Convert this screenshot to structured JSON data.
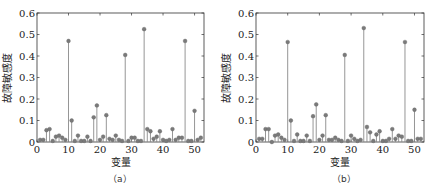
{
  "chart_data": [
    {
      "type": "stem",
      "panel_label": "（a）",
      "title": "",
      "xlabel": "变量",
      "ylabel": "故障敏感度",
      "xlim": [
        0,
        53
      ],
      "ylim": [
        0,
        0.6
      ],
      "xticks": [
        0,
        10,
        20,
        30,
        40,
        50
      ],
      "yticks": [
        0,
        0.1,
        0.2,
        0.3,
        0.4,
        0.5,
        0.6
      ],
      "ytick_labels": [
        "0",
        "0.1",
        "0.2",
        "0.3",
        "0.4",
        "0.5",
        "0.6"
      ],
      "grid": false,
      "x": [
        1,
        2,
        3,
        4,
        5,
        6,
        7,
        8,
        9,
        10,
        11,
        12,
        13,
        14,
        15,
        16,
        17,
        18,
        19,
        20,
        21,
        22,
        23,
        24,
        25,
        26,
        27,
        28,
        29,
        30,
        31,
        32,
        33,
        34,
        35,
        36,
        37,
        38,
        39,
        40,
        41,
        42,
        43,
        44,
        45,
        46,
        47,
        48,
        49,
        50,
        51,
        52
      ],
      "values": [
        0.01,
        0.01,
        0.055,
        0.06,
        0.005,
        0.025,
        0.03,
        0.02,
        0.01,
        0.47,
        0.1,
        0.005,
        0.03,
        0.005,
        0.005,
        0.025,
        0.005,
        0.115,
        0.17,
        0.01,
        0.025,
        0.125,
        0.015,
        0.01,
        0.03,
        0.01,
        0.005,
        0.405,
        0.005,
        0.02,
        0.02,
        0.005,
        0.005,
        0.525,
        0.06,
        0.05,
        0.015,
        0.025,
        0.05,
        0.01,
        0.005,
        0.01,
        0.06,
        0.01,
        0.02,
        0.02,
        0.47,
        0.005,
        0.005,
        0.145,
        0.01,
        0.02
      ]
    },
    {
      "type": "stem",
      "panel_label": "（b）",
      "title": "",
      "xlabel": "变量",
      "ylabel": "故障敏感度",
      "xlim": [
        0,
        53
      ],
      "ylim": [
        0,
        0.6
      ],
      "xticks": [
        0,
        10,
        20,
        30,
        40,
        50
      ],
      "yticks": [
        0,
        0.1,
        0.2,
        0.3,
        0.4,
        0.5,
        0.6
      ],
      "ytick_labels": [
        "0",
        "0.1",
        "0.2",
        "0.3",
        "0.4",
        "0.5",
        "0.6"
      ],
      "grid": false,
      "x": [
        1,
        2,
        3,
        4,
        5,
        6,
        7,
        8,
        9,
        10,
        11,
        12,
        13,
        14,
        15,
        16,
        17,
        18,
        19,
        20,
        21,
        22,
        23,
        24,
        25,
        26,
        27,
        28,
        29,
        30,
        31,
        32,
        33,
        34,
        35,
        36,
        37,
        38,
        39,
        40,
        41,
        42,
        43,
        44,
        45,
        46,
        47,
        48,
        49,
        50,
        51,
        52
      ],
      "values": [
        0.015,
        0.015,
        0.06,
        0.06,
        0.0,
        0.03,
        0.035,
        0.02,
        0.01,
        0.465,
        0.1,
        0.005,
        0.035,
        0.005,
        0.005,
        0.03,
        0.005,
        0.12,
        0.175,
        0.01,
        0.03,
        0.125,
        0.01,
        0.01,
        0.02,
        0.01,
        0.005,
        0.405,
        0.005,
        0.03,
        0.015,
        0.005,
        0.01,
        0.53,
        0.07,
        0.045,
        0.005,
        0.035,
        0.05,
        0.005,
        0.005,
        0.015,
        0.06,
        0.015,
        0.03,
        0.025,
        0.465,
        0.005,
        0.005,
        0.15,
        0.015,
        0.015
      ]
    }
  ],
  "captions": {
    "a": "（a）",
    "b": "（b）"
  },
  "colors": {
    "stem": "#8a8a8a",
    "marker": "#7a7a7a",
    "axis": "#333333",
    "text": "#222222"
  }
}
